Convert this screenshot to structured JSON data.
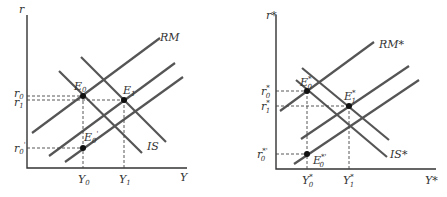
{
  "left_panel": {
    "y_axis_label": "r",
    "x_axis_label": "Y",
    "curves": {
      "rm": "RM",
      "is": "IS"
    },
    "points": {
      "e0": "E",
      "e0_sub": "0",
      "e1": "E",
      "e1_sub": "1",
      "e0p": "E",
      "e0p_sub": "0",
      "e0p_prime": "'"
    },
    "y_ticks": {
      "r0": "r",
      "r0_sub": "0",
      "r1": "r",
      "r1_sub": "1",
      "r0p": "r",
      "r0p_sub": "0",
      "r0p_prime": "'"
    },
    "x_ticks": {
      "y0": "Y",
      "y0_sub": "0",
      "y1": "Y",
      "y1_sub": "1"
    }
  },
  "right_panel": {
    "y_axis_label": "r*",
    "x_axis_label": "Y*",
    "curves": {
      "rm": "RM*",
      "is": "IS*"
    },
    "points": {
      "e0": "E",
      "e0_sup": "*",
      "e0_sub": "0",
      "e1": "E",
      "e1_sup": "*",
      "e1_sub": "1",
      "e0p": "E",
      "e0p_sup": "*'",
      "e0p_sub": "0"
    },
    "y_ticks": {
      "r0": "r",
      "r0_sup": "*",
      "r0_sub": "0",
      "r1": "r",
      "r1_sup": "*",
      "r1_sub": "1",
      "r0p": "r",
      "r0p_sup": "*'",
      "r0p_sub": "0"
    },
    "x_ticks": {
      "y0": "Y",
      "y0_sup": "*",
      "y0_sub": "0",
      "y1": "Y",
      "y1_sup": "*",
      "y1_sub": "1"
    }
  }
}
